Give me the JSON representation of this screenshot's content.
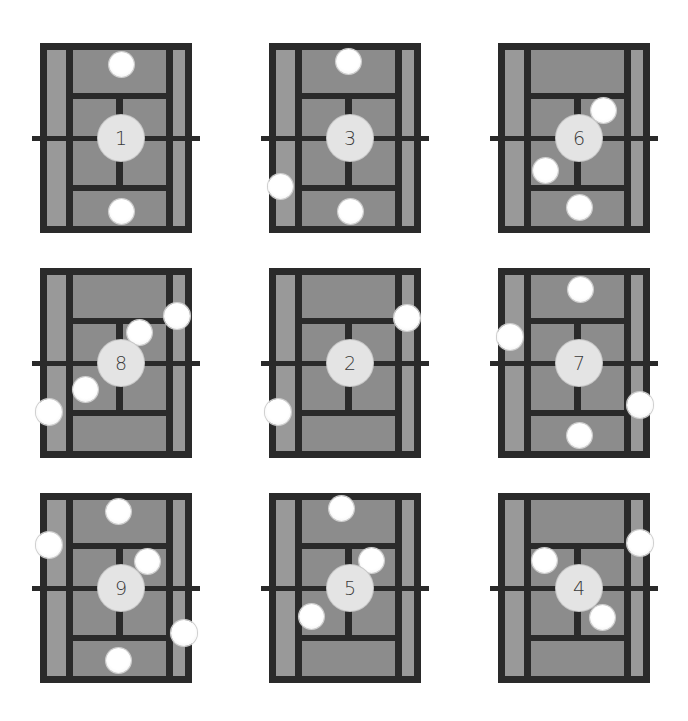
{
  "colors": {
    "background": "#ffffff",
    "court_surface": "#8c8c8c",
    "alley_surface": "#999999",
    "lines": "#2a2a2a",
    "ball": "#ffffff",
    "player_marker": "#e4e4e4",
    "label_text": "#3a3a3a"
  },
  "courts": [
    {
      "id": "court-1",
      "label": "1",
      "x": 40,
      "y": 43
    },
    {
      "id": "court-3",
      "label": "3",
      "x": 269,
      "y": 43
    },
    {
      "id": "court-6",
      "label": "6",
      "x": 498,
      "y": 43
    },
    {
      "id": "court-8",
      "label": "8",
      "x": 40,
      "y": 268
    },
    {
      "id": "court-2",
      "label": "2",
      "x": 269,
      "y": 268
    },
    {
      "id": "court-7",
      "label": "7",
      "x": 498,
      "y": 268
    },
    {
      "id": "court-9",
      "label": "9",
      "x": 40,
      "y": 493
    },
    {
      "id": "court-5",
      "label": "5",
      "x": 269,
      "y": 493
    },
    {
      "id": "court-4",
      "label": "4",
      "x": 498,
      "y": 493
    }
  ]
}
